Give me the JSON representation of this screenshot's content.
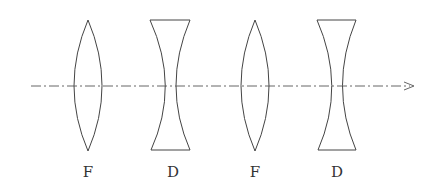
{
  "diagram": {
    "axis": {
      "style": "dash-dot",
      "direction": "right-arrow"
    },
    "lenses": [
      {
        "type": "convex",
        "label": "F"
      },
      {
        "type": "concave",
        "label": "D"
      },
      {
        "type": "convex",
        "label": "F"
      },
      {
        "type": "concave",
        "label": "D"
      }
    ]
  }
}
